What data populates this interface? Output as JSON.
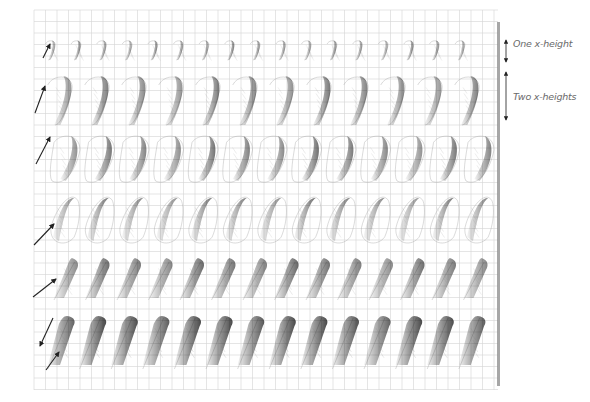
{
  "figure": {
    "type": "calligraphy-practice-sheet",
    "background": "#ffffff",
    "grid": {
      "x": 34,
      "y": 10,
      "width": 464,
      "height": 380,
      "cell": 11.5,
      "color": "#d4d4d4"
    },
    "ruler": {
      "x": 498,
      "y1": 22,
      "y2": 386,
      "color": "#8a8a8a"
    },
    "ink_color": "#3a3a3a",
    "annotations": [
      {
        "id": "one-x-height",
        "text": "One x-height",
        "x": 513,
        "y": 43,
        "arrow_y1": 40,
        "arrow_y2": 62
      },
      {
        "id": "two-x-heights",
        "text": "Two x-heights",
        "x": 513,
        "y": 96,
        "arrow_y1": 72,
        "arrow_y2": 120
      }
    ],
    "rows": [
      {
        "name": "row-1-small-hooks",
        "shape": "hook",
        "y_top": 40,
        "y_bottom": 60,
        "count": 17,
        "x_start": 48,
        "spacing": 25.6,
        "darkness": 0.35,
        "direction_arrows": [
          {
            "x1": 43,
            "y1": 58,
            "x2": 50,
            "y2": 44
          }
        ]
      },
      {
        "name": "row-2-tall-hooks",
        "shape": "hook",
        "y_top": 75,
        "y_bottom": 125,
        "count": 12,
        "x_start": 54,
        "spacing": 37,
        "darkness": 0.4,
        "direction_arrows": [
          {
            "x1": 35,
            "y1": 113,
            "x2": 45,
            "y2": 86
          }
        ]
      },
      {
        "name": "row-3-loops",
        "shape": "loop",
        "y_top": 135,
        "y_bottom": 185,
        "count": 13,
        "x_start": 58,
        "spacing": 34.5,
        "darkness": 0.42,
        "direction_arrows": [
          {
            "x1": 36,
            "y1": 164,
            "x2": 50,
            "y2": 137
          }
        ]
      },
      {
        "name": "row-4-ovals",
        "shape": "oval",
        "y_top": 195,
        "y_bottom": 245,
        "count": 13,
        "x_start": 55,
        "spacing": 34.5,
        "darkness": 0.42,
        "direction_arrows": [
          {
            "x1": 34,
            "y1": 245,
            "x2": 54,
            "y2": 224
          }
        ]
      },
      {
        "name": "row-5-diagonals",
        "shape": "diagonal",
        "y_top": 258,
        "y_bottom": 300,
        "count": 14,
        "x_start": 62,
        "spacing": 31.5,
        "darkness": 0.45,
        "direction_arrows": [
          {
            "x1": 33,
            "y1": 297,
            "x2": 56,
            "y2": 279
          }
        ]
      },
      {
        "name": "row-6-bars",
        "shape": "bar",
        "y_top": 316,
        "y_bottom": 365,
        "count": 14,
        "x_start": 58,
        "spacing": 31.6,
        "darkness": 0.6,
        "direction_arrows": [
          {
            "x1": 53,
            "y1": 318,
            "x2": 40,
            "y2": 346
          },
          {
            "x1": 46,
            "y1": 370,
            "x2": 59,
            "y2": 352
          }
        ]
      }
    ]
  }
}
